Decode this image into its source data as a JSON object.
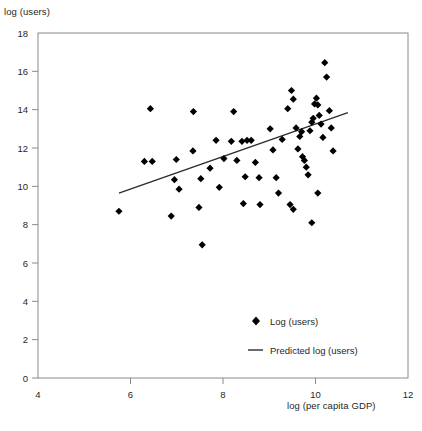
{
  "chart_data": {
    "type": "scatter",
    "title": "",
    "xlabel": "log (per capita GDP)",
    "ylabel": "log (users)",
    "xlim": [
      4,
      12
    ],
    "ylim": [
      0,
      18
    ],
    "xticks": [
      4,
      6,
      8,
      10,
      12
    ],
    "yticks": [
      0,
      2,
      4,
      6,
      8,
      10,
      12,
      14,
      16,
      18
    ],
    "grid": false,
    "legend_position": "inside-bottom-right",
    "legend": [
      {
        "label": "Log (users)",
        "marker": "diamond",
        "color": "#000000"
      },
      {
        "label": "Predicted log (users)",
        "marker": "line",
        "color": "#2b2b2b"
      }
    ],
    "series": [
      {
        "name": "Log (users)",
        "type": "scatter",
        "marker": "diamond",
        "color": "#000000",
        "points": [
          [
            5.75,
            8.7
          ],
          [
            6.3,
            11.3
          ],
          [
            6.47,
            11.3
          ],
          [
            6.43,
            14.05
          ],
          [
            6.99,
            11.4
          ],
          [
            6.95,
            10.35
          ],
          [
            7.05,
            9.85
          ],
          [
            6.88,
            8.45
          ],
          [
            7.35,
            11.85
          ],
          [
            7.36,
            13.9
          ],
          [
            7.52,
            10.4
          ],
          [
            7.48,
            8.9
          ],
          [
            7.55,
            6.95
          ],
          [
            7.72,
            10.95
          ],
          [
            7.85,
            12.4
          ],
          [
            7.92,
            9.95
          ],
          [
            8.02,
            11.45
          ],
          [
            8.18,
            12.35
          ],
          [
            8.23,
            13.9
          ],
          [
            8.3,
            11.35
          ],
          [
            8.41,
            12.35
          ],
          [
            8.52,
            12.4
          ],
          [
            8.48,
            10.5
          ],
          [
            8.44,
            9.1
          ],
          [
            8.61,
            12.4
          ],
          [
            8.7,
            11.25
          ],
          [
            8.78,
            10.45
          ],
          [
            8.8,
            9.05
          ],
          [
            9.02,
            13.0
          ],
          [
            9.08,
            11.9
          ],
          [
            9.15,
            10.45
          ],
          [
            9.2,
            9.65
          ],
          [
            9.28,
            12.45
          ],
          [
            9.4,
            14.05
          ],
          [
            9.48,
            15.0
          ],
          [
            9.52,
            14.55
          ],
          [
            9.58,
            13.05
          ],
          [
            9.62,
            11.95
          ],
          [
            9.66,
            12.6
          ],
          [
            9.7,
            12.85
          ],
          [
            9.72,
            11.55
          ],
          [
            9.76,
            11.35
          ],
          [
            9.8,
            11.0
          ],
          [
            9.84,
            10.6
          ],
          [
            9.88,
            12.9
          ],
          [
            9.92,
            13.35
          ],
          [
            9.95,
            13.55
          ],
          [
            9.98,
            14.3
          ],
          [
            10.02,
            14.6
          ],
          [
            10.05,
            14.25
          ],
          [
            10.08,
            13.7
          ],
          [
            10.12,
            13.25
          ],
          [
            10.16,
            12.55
          ],
          [
            10.2,
            16.45
          ],
          [
            10.24,
            15.7
          ],
          [
            10.3,
            13.95
          ],
          [
            10.34,
            13.05
          ],
          [
            10.38,
            11.85
          ],
          [
            10.05,
            9.65
          ],
          [
            9.45,
            9.05
          ],
          [
            9.52,
            8.8
          ],
          [
            9.92,
            8.1
          ]
        ]
      },
      {
        "name": "Predicted log (users)",
        "type": "line",
        "color": "#2b2b2b",
        "x": [
          5.75,
          10.7
        ],
        "y": [
          9.65,
          13.85
        ]
      }
    ]
  },
  "axes": {
    "y_title": "log (users)",
    "x_title": "log (per capita GDP)"
  }
}
